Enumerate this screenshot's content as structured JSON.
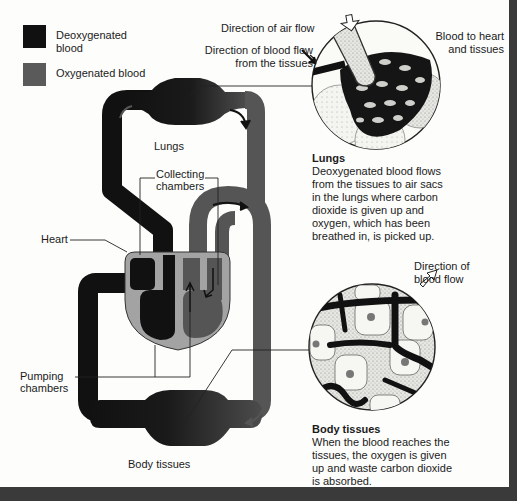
{
  "legend": {
    "items": [
      {
        "label_line1": "Deoxygenated",
        "label_line2": "blood",
        "color": "#111111"
      },
      {
        "label": "Oxygenated blood",
        "color": "#5a5a5a"
      }
    ]
  },
  "colors": {
    "deoxygenated": "#111111",
    "oxygenated": "#555555",
    "heart_body": "#a3a3a3",
    "background": "#fdfdfb",
    "frame": "#3a3a3a"
  },
  "labels": {
    "lungs": "Lungs",
    "collecting_line1": "Collecting",
    "collecting_line2": "chambers",
    "heart": "Heart",
    "pumping_line1": "Pumping",
    "pumping_line2": "chambers",
    "body_tissues": "Body tissues",
    "air_flow": "Direction of air flow",
    "blood_flow_tissues_line1": "Direction of blood flow",
    "blood_flow_tissues_line2": "from the tissues",
    "blood_to_heart_line1": "Blood to heart",
    "blood_to_heart_line2": "and tissues",
    "direction_blood_flow_line1": "Direction of",
    "direction_blood_flow_line2": "blood flow"
  },
  "lungs_caption": {
    "title": "Lungs",
    "lines": [
      "Deoxygenated blood flows",
      "from the tissues to air sacs",
      "in the lungs where carbon",
      "dioxide is given up and",
      "oxygen, which has been",
      "breathed in, is picked up."
    ]
  },
  "tissues_caption": {
    "title": "Body tissues",
    "lines": [
      "When the blood reaches the",
      "tissues, the oxygen is given",
      "up and waste carbon dioxide",
      "is absorbed."
    ]
  }
}
